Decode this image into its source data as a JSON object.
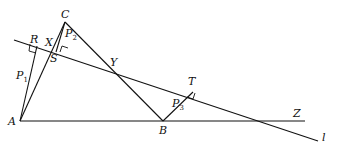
{
  "diagram": {
    "points": {
      "A": {
        "label": "A",
        "x": 20,
        "y": 121
      },
      "B": {
        "label": "B",
        "x": 163,
        "y": 121
      },
      "C": {
        "label": "C",
        "x": 65,
        "y": 22
      },
      "X": {
        "label": "X",
        "x": 53,
        "y": 52
      },
      "Y": {
        "label": "Y",
        "x": 111,
        "y": 68
      },
      "Z": {
        "label": "Z",
        "x": 297,
        "y": 122
      },
      "R": {
        "label": "R",
        "x": 37,
        "y": 46
      },
      "S": {
        "label": "S",
        "x": 53,
        "y": 52
      },
      "T": {
        "label": "T",
        "x": 193,
        "y": 92
      }
    },
    "perpendiculars": [
      {
        "label": "P",
        "sub": "1",
        "from": "A",
        "foot": "R"
      },
      {
        "label": "P",
        "sub": "2",
        "from": "C",
        "foot": "S"
      },
      {
        "label": "P",
        "sub": "3",
        "from": "B",
        "foot": "T"
      }
    ],
    "line_label": "l",
    "labels": {
      "A": "A",
      "B": "B",
      "C": "C",
      "X": "X",
      "Y": "Y",
      "Z": "Z",
      "R": "R",
      "S": "S",
      "T": "T",
      "l": "l",
      "P1": "P",
      "P1_sub": "1",
      "P2": "P",
      "P2_sub": "2",
      "P3": "P",
      "P3_sub": "3"
    }
  }
}
